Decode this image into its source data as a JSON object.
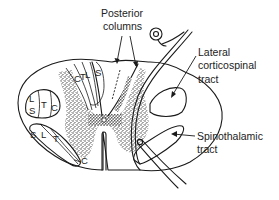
{
  "diagram": {
    "labels": {
      "posterior_columns": [
        "Posterior",
        "columns"
      ],
      "lateral_corticospinal": [
        "Lateral",
        "corticospinal",
        "tract"
      ],
      "spinothalamic": [
        "Spinothalamic",
        "tract"
      ]
    },
    "tract_letters": {
      "posterior_column_fasciculi": [
        "C",
        "T",
        "L",
        "S"
      ],
      "lateral_corticospinal_left": [
        "L",
        "S",
        "T",
        "C"
      ],
      "spinothalamic_left": [
        "S",
        "L",
        "T",
        "C"
      ]
    },
    "colors": {
      "line": "#1a1a1a",
      "gray_matter_stipple": "#333333",
      "background": "#ffffff"
    }
  }
}
